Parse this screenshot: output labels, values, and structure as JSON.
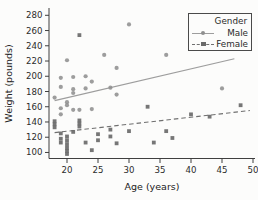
{
  "figure": {
    "background": "#fcfcfb",
    "axis_color": "#3f3f3f",
    "tick_text_color": "#2b2b2b"
  },
  "chart_data": {
    "type": "scatter",
    "title": "",
    "xlabel": "Age (years)",
    "ylabel": "Weight (pounds)",
    "x_ticks": [
      20,
      25,
      30,
      35,
      40,
      45,
      50
    ],
    "y_ticks": [
      100,
      120,
      140,
      160,
      180,
      200,
      220,
      240,
      260,
      280
    ],
    "xlim": [
      17,
      50.5
    ],
    "ylim": [
      92,
      290
    ],
    "grid": false,
    "legend": {
      "title": "Gender",
      "position": "top-right",
      "entries": [
        {
          "label": "Male",
          "marker": "circle",
          "line_style": "solid"
        },
        {
          "label": "Female",
          "marker": "square",
          "line_style": "dashed"
        }
      ]
    },
    "series": [
      {
        "name": "Male",
        "marker": "circle",
        "color": "#8f8f8f",
        "trend_line": {
          "style": "solid",
          "color": "#9d9d9d",
          "x": [
            18,
            47
          ],
          "y": [
            168,
            223
          ]
        },
        "points": [
          [
            19,
            150
          ],
          [
            19,
            158
          ],
          [
            19,
            186
          ],
          [
            19,
            198
          ],
          [
            18,
            172
          ],
          [
            20,
            162
          ],
          [
            20,
            166
          ],
          [
            20,
            221
          ],
          [
            21,
            156
          ],
          [
            21,
            178
          ],
          [
            21,
            183
          ],
          [
            21,
            199
          ],
          [
            22,
            156
          ],
          [
            23,
            184
          ],
          [
            23,
            200
          ],
          [
            24,
            157
          ],
          [
            24,
            193
          ],
          [
            26,
            228
          ],
          [
            27,
            185
          ],
          [
            28,
            176
          ],
          [
            28,
            211
          ],
          [
            30,
            268
          ],
          [
            36,
            228
          ],
          [
            45,
            184
          ]
        ]
      },
      {
        "name": "Female",
        "marker": "square",
        "color": "#6a6a6a",
        "trend_line": {
          "style": "dashed",
          "color": "#6f6f6f",
          "x": [
            18,
            49.5
          ],
          "y": [
            126,
            155
          ]
        },
        "points": [
          [
            18,
            133
          ],
          [
            18,
            137
          ],
          [
            18,
            141
          ],
          [
            19,
            113
          ],
          [
            19,
            118
          ],
          [
            19,
            125
          ],
          [
            20,
            98
          ],
          [
            20,
            102
          ],
          [
            20,
            106
          ],
          [
            20,
            111
          ],
          [
            20,
            116
          ],
          [
            20,
            121
          ],
          [
            21,
            127
          ],
          [
            22,
            134
          ],
          [
            22,
            138
          ],
          [
            22,
            142
          ],
          [
            22,
            254
          ],
          [
            23,
            113
          ],
          [
            24,
            103
          ],
          [
            25,
            116
          ],
          [
            25,
            124
          ],
          [
            27,
            121
          ],
          [
            27,
            130
          ],
          [
            28,
            112
          ],
          [
            30,
            128
          ],
          [
            33,
            160
          ],
          [
            34,
            113
          ],
          [
            36,
            128
          ],
          [
            37,
            119
          ],
          [
            40,
            150
          ],
          [
            43,
            147
          ],
          [
            48,
            162
          ]
        ]
      }
    ]
  }
}
